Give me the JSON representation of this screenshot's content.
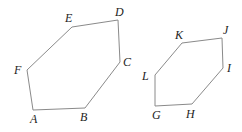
{
  "canvas": {
    "width": 242,
    "height": 132,
    "background_color": "#ffffff"
  },
  "style": {
    "stroke_color": "#8a8a8a",
    "stroke_width": 1,
    "label_color": "#1d1d1d",
    "label_font_size": 12,
    "label_style": "italic-serif"
  },
  "figures": [
    {
      "id": "hexagon-abcdef",
      "name": "hexagon-ABCDEF",
      "type": "polygon",
      "sides": 6,
      "vertex_order": [
        "A",
        "B",
        "C",
        "D",
        "E",
        "F"
      ],
      "points": "33,110 85,108 120,62 118,20 72,27 27,70",
      "vertices": [
        {
          "label": "A",
          "x": 33,
          "y": 110,
          "label_x": 30,
          "label_y": 113
        },
        {
          "label": "B",
          "x": 85,
          "y": 108,
          "label_x": 80,
          "label_y": 111
        },
        {
          "label": "C",
          "x": 120,
          "y": 62,
          "label_x": 123,
          "label_y": 56
        },
        {
          "label": "D",
          "x": 118,
          "y": 20,
          "label_x": 115,
          "label_y": 6
        },
        {
          "label": "E",
          "x": 72,
          "y": 27,
          "label_x": 65,
          "label_y": 12
        },
        {
          "label": "F",
          "x": 27,
          "y": 70,
          "label_x": 14,
          "label_y": 64
        }
      ]
    },
    {
      "id": "hexagon-ghijkl",
      "name": "hexagon-GHIJKL",
      "type": "polygon",
      "sides": 6,
      "vertex_order": [
        "G",
        "H",
        "I",
        "J",
        "K",
        "L"
      ],
      "points": "155,106 192,104 223,68 222,38 182,43 155,75",
      "vertices": [
        {
          "label": "G",
          "x": 155,
          "y": 106,
          "label_x": 152,
          "label_y": 109
        },
        {
          "label": "H",
          "x": 192,
          "y": 104,
          "label_x": 186,
          "label_y": 108
        },
        {
          "label": "I",
          "x": 223,
          "y": 68,
          "label_x": 227,
          "label_y": 62
        },
        {
          "label": "J",
          "x": 222,
          "y": 38,
          "label_x": 223,
          "label_y": 24
        },
        {
          "label": "K",
          "x": 182,
          "y": 43,
          "label_x": 175,
          "label_y": 29
        },
        {
          "label": "L",
          "x": 155,
          "y": 75,
          "label_x": 142,
          "label_y": 70
        }
      ]
    }
  ]
}
